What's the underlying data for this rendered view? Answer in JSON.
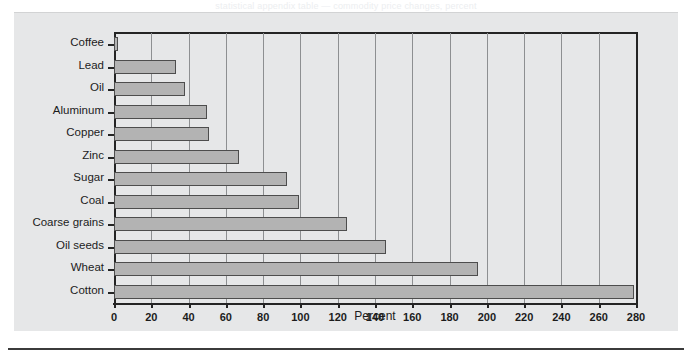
{
  "figure": {
    "scan_residue_text": "statistical appendix table — commodity price changes, percent",
    "panel_background": "#e6e7e8",
    "bar_fill": "#b3b3b3",
    "bar_edge": "#4d4d4d",
    "axis_color": "#242424",
    "grid_color": "#8d8f91"
  },
  "chart_data": {
    "type": "bar",
    "orientation": "horizontal",
    "title": "",
    "xlabel": "Percent",
    "ylabel": "",
    "xlim": [
      0,
      280
    ],
    "xticks": [
      0,
      20,
      40,
      60,
      80,
      100,
      120,
      140,
      160,
      180,
      200,
      220,
      240,
      260,
      280
    ],
    "xtick_labels": [
      "0",
      "20",
      "40",
      "60",
      "80",
      "100",
      "120",
      "140",
      "160",
      "180",
      "200",
      "220",
      "240",
      "260",
      "280"
    ],
    "grid": "vertical",
    "legend": "none",
    "categories": [
      "Coffee",
      "Lead",
      "Oil",
      "Aluminum",
      "Copper",
      "Zinc",
      "Sugar",
      "Coal",
      "Coarse grains",
      "Oil seeds",
      "Wheat",
      "Cotton"
    ],
    "values": [
      2,
      33,
      38,
      50,
      51,
      67,
      93,
      99,
      125,
      146,
      195,
      279
    ]
  }
}
